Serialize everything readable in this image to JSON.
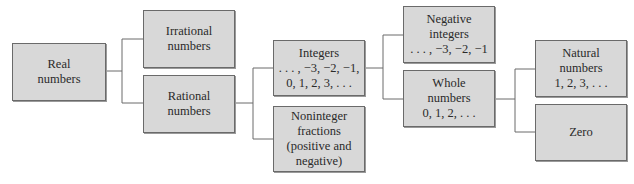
{
  "diagram": {
    "nodes": {
      "real": {
        "lines": [
          "Real",
          "numbers"
        ]
      },
      "irrational": {
        "lines": [
          "Irrational",
          "numbers"
        ]
      },
      "rational": {
        "lines": [
          "Rational",
          "numbers"
        ]
      },
      "integers": {
        "lines": [
          "Integers",
          ". . . , −3, −2, −1,",
          "0, 1, 2, 3, . . ."
        ]
      },
      "noninteger": {
        "lines": [
          "Noninteger",
          "fractions",
          "(positive and",
          "negative)"
        ]
      },
      "negative_integers": {
        "lines": [
          "Negative",
          "integers",
          ". . . , −3, −2, −1"
        ]
      },
      "whole": {
        "lines": [
          "Whole",
          "numbers",
          "0, 1, 2, . . ."
        ]
      },
      "natural": {
        "lines": [
          "Natural",
          "numbers",
          "1, 2, 3, . . ."
        ]
      },
      "zero": {
        "lines": [
          "Zero"
        ]
      }
    },
    "edges": [
      [
        "real",
        "irrational"
      ],
      [
        "real",
        "rational"
      ],
      [
        "rational",
        "integers"
      ],
      [
        "rational",
        "noninteger"
      ],
      [
        "integers",
        "negative_integers"
      ],
      [
        "integers",
        "whole"
      ],
      [
        "whole",
        "natural"
      ],
      [
        "whole",
        "zero"
      ]
    ],
    "colors": {
      "box_fill": "#d8d8d8",
      "box_border": "#6a6a6a",
      "line": "#6a6a6a",
      "text": "#2a2a2a"
    }
  }
}
